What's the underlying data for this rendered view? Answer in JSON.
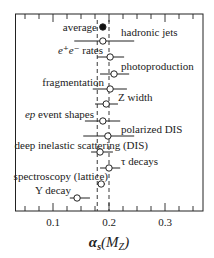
{
  "chart_data": {
    "type": "scatter",
    "subtype": "forest-plot-with-horizontal-error-bars",
    "title": "",
    "xlabel": "αs(MZ)",
    "xlabel_parts": {
      "alpha": "α",
      "sub": "s",
      "paren_open": "(",
      "M": "M",
      "msub": "Z",
      "paren_close": ")"
    },
    "ylabel": "",
    "xlim": [
      0.034,
      0.367
    ],
    "xticks_major": [
      0.1,
      0.2,
      0.3
    ],
    "xtick_labels": [
      "0.1",
      "0.2",
      "0.3"
    ],
    "minor_tick_step": 0.025,
    "grid": false,
    "band": {
      "low": 0.179,
      "high": 0.2,
      "style": "dashed vertical lines"
    },
    "points": [
      {
        "label": "average",
        "value": 0.189,
        "low": 0.189,
        "high": 0.189,
        "marker": "filled",
        "label_side": "left"
      },
      {
        "label": "hadronic jets",
        "value": 0.189,
        "low": 0.138,
        "high": 0.245,
        "marker": "open",
        "label_side": "right"
      },
      {
        "label": "e⁺e⁻ rates",
        "value": 0.202,
        "low": 0.179,
        "high": 0.227,
        "marker": "open",
        "label_side": "left"
      },
      {
        "label": "photoproduction",
        "value": 0.209,
        "low": 0.184,
        "high": 0.236,
        "marker": "open",
        "label_side": "right"
      },
      {
        "label": "fragmentation",
        "value": 0.202,
        "low": 0.171,
        "high": 0.232,
        "marker": "open",
        "label_side": "left"
      },
      {
        "label": "Z width",
        "value": 0.195,
        "low": 0.175,
        "high": 0.216,
        "marker": "open",
        "label_side": "right"
      },
      {
        "label": "ep event shapes",
        "value": 0.189,
        "low": 0.157,
        "high": 0.22,
        "marker": "open",
        "label_side": "left"
      },
      {
        "label": "polarized DIS",
        "value": 0.198,
        "low": 0.154,
        "high": 0.245,
        "marker": "open",
        "label_side": "right"
      },
      {
        "label": "deep inelastic scattering (DIS)",
        "value": 0.184,
        "low": 0.168,
        "high": 0.207,
        "marker": "open",
        "label_side": "left"
      },
      {
        "label": "τ decays",
        "value": 0.2,
        "low": 0.184,
        "high": 0.22,
        "marker": "open",
        "label_side": "right"
      },
      {
        "label": "spectroscopy (lattice)",
        "value": 0.186,
        "low": 0.179,
        "high": 0.193,
        "marker": "open",
        "label_side": "left"
      },
      {
        "label": "Υ decay",
        "value": 0.143,
        "low": 0.13,
        "high": 0.166,
        "marker": "open",
        "label_side": "left"
      }
    ],
    "layout": {
      "frame": {
        "left": 15.5,
        "top": 14,
        "right": 203,
        "bottom": 211
      },
      "point_y": [
        27,
        41,
        57,
        74,
        89,
        104,
        121,
        136,
        152,
        168,
        184,
        198
      ],
      "label_pos": [
        {
          "x": 97,
          "y": 31,
          "anchor": "end"
        },
        {
          "x": 121,
          "y": 36,
          "anchor": "start"
        },
        {
          "x": 103,
          "y": 54,
          "anchor": "end"
        },
        {
          "x": 121,
          "y": 70,
          "anchor": "start"
        },
        {
          "x": 104,
          "y": 86,
          "anchor": "end"
        },
        {
          "x": 118,
          "y": 101,
          "anchor": "start"
        },
        {
          "x": 94,
          "y": 118,
          "anchor": "end"
        },
        {
          "x": 121,
          "y": 133,
          "anchor": "start"
        },
        {
          "x": 148,
          "y": 149,
          "anchor": "end"
        },
        {
          "x": 121,
          "y": 165,
          "anchor": "start"
        },
        {
          "x": 108,
          "y": 180,
          "anchor": "end"
        },
        {
          "x": 71,
          "y": 194,
          "anchor": "end"
        }
      ]
    },
    "colors": {
      "ink": "#222222",
      "background": "#ffffff",
      "marker_fill_open": "#ffffff",
      "marker_fill_avg": "#111111"
    }
  }
}
